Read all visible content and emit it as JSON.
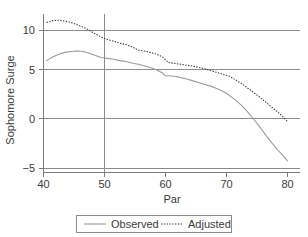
{
  "chart_data": {
    "type": "line",
    "title": "",
    "xlabel": "Par",
    "ylabel": "Sophomore Surge",
    "xlim": [
      40,
      80
    ],
    "ylim": [
      -5,
      12
    ],
    "xticks": [
      40,
      50,
      60,
      70,
      80
    ],
    "yticks": [
      10,
      5,
      0,
      -5
    ],
    "xtick_labels": [
      "40",
      "50",
      "60",
      "70",
      "80"
    ],
    "ytick_labels": [
      "10",
      "5",
      "0",
      "−5"
    ],
    "grid": "horizontal gridlines at y = 10, 5, 0, -5; vertical gridline at x = 50",
    "legend_position": "below-axes-center",
    "series": [
      {
        "name": "Observed",
        "style": "solid",
        "color": "#9a9a9a",
        "x": [
          40.5,
          41.5,
          42.5,
          43.5,
          44.5,
          45.5,
          46.5,
          47.5,
          48.5,
          49.5,
          50.5,
          51.5,
          52.5,
          53.5,
          54.5,
          55.5,
          56.5,
          57.5,
          58.5,
          59.5,
          60.0,
          60.5,
          61.5,
          62.5,
          63.5,
          64.5,
          65.5,
          66.5,
          67.5,
          68.5,
          69.5,
          70.5,
          71.5,
          72.5,
          73.5,
          74.5,
          75.5,
          76.5,
          77.5,
          78.5,
          79.5,
          80.0
        ],
        "y": [
          6.7,
          7.1,
          7.4,
          7.6,
          7.7,
          7.75,
          7.7,
          7.5,
          7.25,
          7.05,
          6.95,
          6.85,
          6.7,
          6.6,
          6.45,
          6.3,
          6.15,
          5.95,
          5.7,
          5.35,
          5.05,
          5.05,
          5.0,
          4.85,
          4.7,
          4.5,
          4.3,
          4.1,
          3.9,
          3.65,
          3.35,
          2.9,
          2.4,
          1.8,
          1.1,
          0.3,
          -0.55,
          -1.45,
          -2.3,
          -3.1,
          -3.8,
          -4.2
        ]
      },
      {
        "name": "Adjusted",
        "style": "dotted",
        "color": "#3d3d3d",
        "x": [
          40.5,
          41.5,
          42.5,
          43.5,
          44.5,
          45.5,
          46.5,
          47.5,
          48.5,
          49.5,
          50.5,
          51.5,
          52.5,
          53.5,
          54.5,
          55.5,
          56.5,
          57.5,
          58.5,
          59.5,
          60.5,
          61.5,
          62.5,
          63.5,
          64.5,
          65.5,
          66.5,
          67.5,
          68.5,
          69.5,
          70.5,
          71.5,
          72.5,
          73.5,
          74.5,
          75.5,
          76.5,
          77.5,
          78.5,
          79.5,
          80.0
        ],
        "y": [
          10.85,
          11.05,
          11.1,
          11.0,
          10.85,
          10.6,
          10.35,
          10.0,
          9.6,
          9.25,
          9.0,
          8.8,
          8.6,
          8.45,
          8.2,
          7.85,
          7.75,
          7.6,
          7.4,
          7.1,
          6.5,
          6.4,
          6.3,
          6.2,
          6.1,
          5.95,
          5.8,
          5.6,
          5.4,
          5.2,
          5.0,
          4.6,
          4.2,
          3.7,
          3.2,
          2.7,
          2.15,
          1.6,
          1.05,
          0.45,
          0.05
        ]
      }
    ],
    "annotations": [
      "Observed series shows a small discontinuity / flat segment near Par = 60 at Sophomore Surge ≈ 5",
      "Observed crosses zero near Par ≈ 74.7",
      "Adjusted ends near zero at Par = 80"
    ]
  },
  "legend": {
    "items": [
      {
        "label": "Observed",
        "style": "solid"
      },
      {
        "label": "Adjusted",
        "style": "dotted"
      }
    ]
  },
  "axes": {
    "x_title": "Par",
    "y_title": "Sophomore Surge"
  }
}
